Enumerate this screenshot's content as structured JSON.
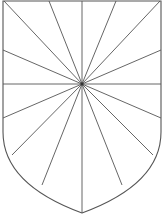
{
  "figure": {
    "stroke_color": "#555555",
    "fill_color": "#ffffff",
    "center": [
      82,
      84
    ],
    "shield_outline": {
      "top_left": [
        3,
        1
      ],
      "top_right": [
        161,
        1
      ],
      "side_bottom_left": [
        3,
        132
      ],
      "side_bottom_right": [
        161,
        132
      ],
      "tip": [
        82,
        213
      ]
    },
    "ray_endpoints": [
      [
        82,
        1
      ],
      [
        116,
        1
      ],
      [
        160,
        1
      ],
      [
        161,
        50
      ],
      [
        161,
        84
      ],
      [
        161,
        118
      ],
      [
        153,
        155
      ],
      [
        122,
        185
      ],
      [
        82,
        213
      ],
      [
        42,
        185
      ],
      [
        12,
        155
      ],
      [
        3,
        118
      ],
      [
        3,
        84
      ],
      [
        3,
        50
      ],
      [
        4,
        1
      ],
      [
        49,
        1
      ]
    ]
  }
}
